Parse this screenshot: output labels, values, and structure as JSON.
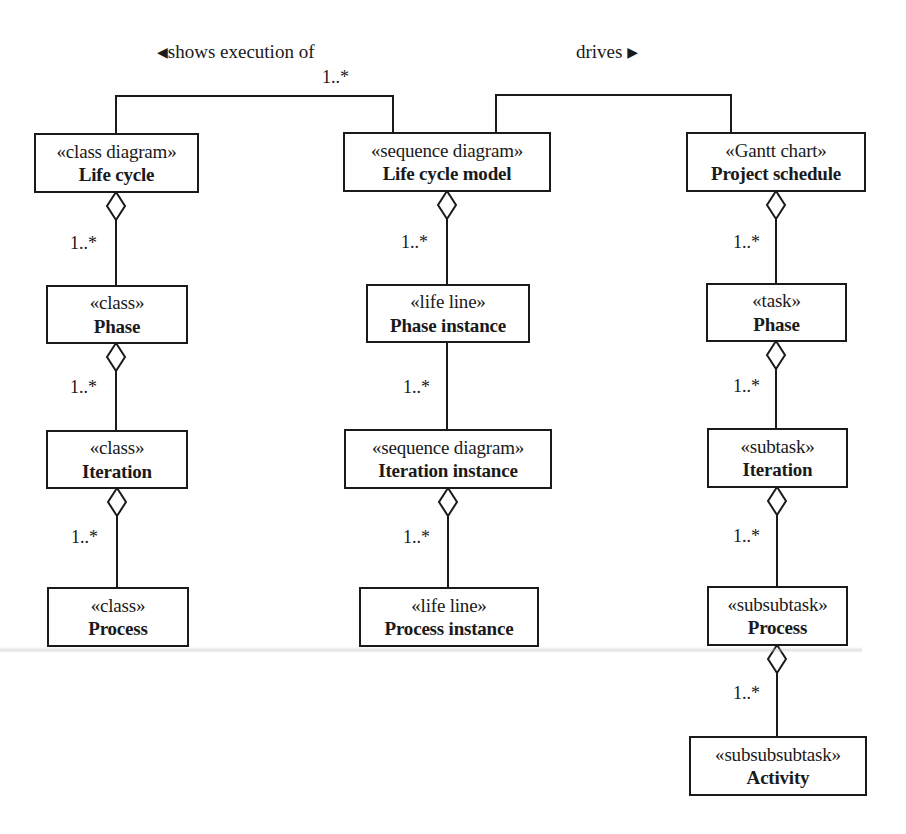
{
  "diagram": {
    "type": "uml-class-relationship",
    "associations": [
      {
        "id": "shows-execution-of",
        "label": "shows execution of",
        "direction_glyph": "◀",
        "multiplicity": "1..*",
        "from": "life-cycle",
        "to": "life-cycle-model"
      },
      {
        "id": "drives",
        "label": "drives",
        "direction_glyph": "▶",
        "from": "life-cycle-model",
        "to": "project-schedule"
      }
    ],
    "columns": [
      {
        "id": "class-column",
        "boxes": [
          {
            "stereotype": "«class diagram»",
            "name": "Life cycle"
          },
          {
            "stereotype": "«class»",
            "name": "Phase"
          },
          {
            "stereotype": "«class»",
            "name": "Iteration"
          },
          {
            "stereotype": "«class»",
            "name": "Process"
          }
        ],
        "multiplicities": [
          "1..*",
          "1..*",
          "1..*"
        ]
      },
      {
        "id": "sequence-column",
        "boxes": [
          {
            "stereotype": "«sequence diagram»",
            "name": "Life cycle model"
          },
          {
            "stereotype": "«life line»",
            "name": "Phase instance"
          },
          {
            "stereotype": "«sequence diagram»",
            "name": "Iteration instance"
          },
          {
            "stereotype": "«life line»",
            "name": "Process instance"
          }
        ],
        "multiplicities": [
          "1..*",
          "1..*",
          "1..*"
        ]
      },
      {
        "id": "gantt-column",
        "boxes": [
          {
            "stereotype": "«Gantt chart»",
            "name": "Project schedule"
          },
          {
            "stereotype": "«task»",
            "name": "Phase"
          },
          {
            "stereotype": "«subtask»",
            "name": "Iteration"
          },
          {
            "stereotype": "«subsubtask»",
            "name": "Process"
          },
          {
            "stereotype": "«subsubsubtask»",
            "name": "Activity"
          }
        ],
        "multiplicities": [
          "1..*",
          "1..*",
          "1..*",
          "1..*"
        ]
      }
    ],
    "relationship_symbol": "aggregation-diamond",
    "line_color": "#1a1a1a",
    "background_color": "#ffffff"
  }
}
